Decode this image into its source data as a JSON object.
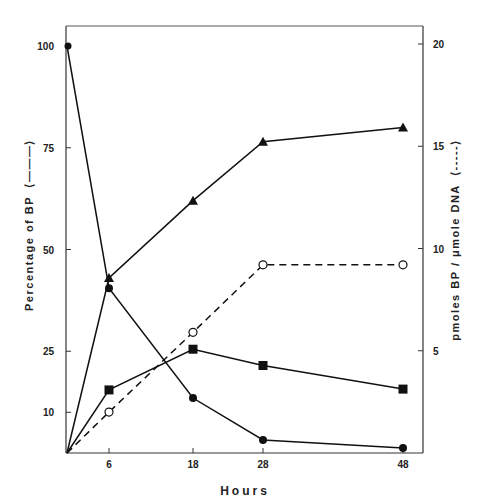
{
  "chart_data": {
    "type": "line",
    "title": "",
    "xlabel": "Hours",
    "ylabel_left": "Percentage of BP",
    "ylabel_left_legend": "(———)",
    "ylabel_right": "pmoles BP / μmole DNA",
    "ylabel_right_legend": "(- - - - -)",
    "x_ticks": [
      6,
      18,
      28,
      48
    ],
    "y_left_ticks": [
      10,
      25,
      50,
      75,
      100
    ],
    "y_right_ticks": [
      5,
      10,
      15,
      20
    ],
    "xlim": [
      0,
      48
    ],
    "ylim_left": [
      0,
      100
    ],
    "ylim_right": [
      0,
      20
    ],
    "grid": false,
    "legend": "none (line style encoded in axis titles)",
    "series": [
      {
        "name": "filled circle (solid line)",
        "marker": "filled-circle",
        "line": "solid",
        "axis": "left",
        "x": [
          0,
          6,
          18,
          28,
          48
        ],
        "values": [
          100,
          40.5,
          13.5,
          3.2,
          1.2
        ]
      },
      {
        "name": "filled triangle (solid line)",
        "marker": "filled-triangle",
        "line": "solid",
        "axis": "left",
        "x": [
          0,
          6,
          18,
          28,
          48
        ],
        "values": [
          0,
          43,
          62,
          76.5,
          80
        ]
      },
      {
        "name": "filled square (solid line)",
        "marker": "filled-square",
        "line": "solid",
        "axis": "left",
        "x": [
          0,
          6,
          18,
          28,
          48
        ],
        "values": [
          0,
          15.5,
          25.5,
          21.5,
          15.7
        ]
      },
      {
        "name": "open circle (dashed line)",
        "marker": "open-circle",
        "line": "dashed",
        "axis": "right",
        "x": [
          0,
          6,
          18,
          28,
          48
        ],
        "values": [
          0,
          2.0,
          5.9,
          9.2,
          9.2
        ]
      }
    ]
  },
  "labels": {
    "x_title": "Hours",
    "left_title": "Percentage of BP",
    "left_legend": "⟨———⟩",
    "right_title": "pmoles BP / μmole DNA",
    "right_legend": "⟨-----⟩"
  }
}
